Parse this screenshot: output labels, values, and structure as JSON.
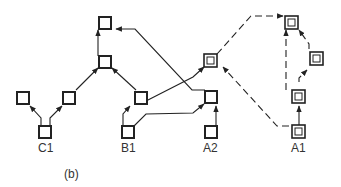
{
  "figure": {
    "caption": "(b)",
    "labels": {
      "c1": "C1",
      "b1": "B1",
      "a2": "A2",
      "a1": "A1"
    },
    "colors": {
      "stroke": "#222222",
      "background": "#ffffff",
      "text": "#333333"
    }
  },
  "nodes": [
    {
      "id": "c1",
      "label": "C1",
      "type": "single"
    },
    {
      "id": "c1-left",
      "type": "single"
    },
    {
      "id": "c1-right",
      "type": "single"
    },
    {
      "id": "mid",
      "type": "single"
    },
    {
      "id": "top",
      "type": "single"
    },
    {
      "id": "b1-upper",
      "type": "single"
    },
    {
      "id": "b1",
      "label": "B1",
      "type": "single"
    },
    {
      "id": "a2-double",
      "type": "double"
    },
    {
      "id": "a2-upper",
      "type": "single"
    },
    {
      "id": "a2",
      "label": "A2",
      "type": "single"
    },
    {
      "id": "a1-top",
      "type": "double"
    },
    {
      "id": "a1-right",
      "type": "double"
    },
    {
      "id": "a1-mid",
      "type": "double"
    },
    {
      "id": "a1",
      "label": "A1",
      "type": "double"
    }
  ],
  "edges": [
    {
      "from": "c1",
      "to": "c1-left",
      "style": "solid"
    },
    {
      "from": "c1",
      "to": "c1-right",
      "style": "solid"
    },
    {
      "from": "c1-right",
      "to": "mid",
      "style": "solid"
    },
    {
      "from": "mid",
      "to": "top",
      "style": "solid"
    },
    {
      "from": "b1",
      "to": "b1-upper",
      "style": "solid"
    },
    {
      "from": "b1-upper",
      "to": "mid",
      "style": "solid"
    },
    {
      "from": "b1-upper",
      "to": "a2-double",
      "style": "solid"
    },
    {
      "from": "b1",
      "to": "a2-upper",
      "style": "solid"
    },
    {
      "from": "a2-upper",
      "to": "top",
      "style": "solid"
    },
    {
      "from": "a2",
      "to": "a2-upper",
      "style": "solid"
    },
    {
      "from": "a2-double",
      "to": "a1-top",
      "style": "dashed"
    },
    {
      "from": "a1",
      "to": "a2-double",
      "style": "dashed"
    },
    {
      "from": "a1",
      "to": "a1-mid",
      "style": "solid"
    },
    {
      "from": "a1-mid",
      "to": "a1-top",
      "style": "dashed"
    },
    {
      "from": "a1-mid",
      "to": "a1-right",
      "style": "dashed"
    },
    {
      "from": "a1-right",
      "to": "a1-top",
      "style": "dashed"
    }
  ]
}
